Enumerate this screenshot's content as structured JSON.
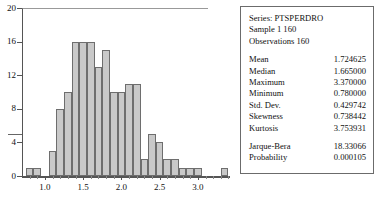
{
  "chart_data": {
    "type": "bar",
    "title": "",
    "xlabel": "",
    "ylabel": "",
    "ylim": [
      0,
      20
    ],
    "xlim": [
      0.7,
      3.42
    ],
    "grid": false,
    "legend": "none",
    "yticks": [
      0,
      4,
      8,
      12,
      16,
      20
    ],
    "xticks": [
      1.0,
      1.5,
      2.0,
      2.5,
      3.0
    ],
    "xtick_labels": [
      "1.0",
      "1.5",
      "2.0",
      "2.5",
      "3.0"
    ],
    "bin_width": 0.1,
    "bin_starts": [
      0.75,
      0.85,
      1.05,
      1.15,
      1.25,
      1.35,
      1.45,
      1.55,
      1.65,
      1.75,
      1.85,
      1.95,
      2.05,
      2.15,
      2.25,
      2.35,
      2.45,
      2.55,
      2.65,
      2.75,
      2.85,
      2.95,
      3.3
    ],
    "values": [
      1,
      1,
      3,
      8,
      10,
      16,
      16,
      16,
      13,
      15,
      10,
      10,
      11,
      11,
      2,
      5,
      4,
      2,
      2,
      1,
      1,
      1,
      1
    ],
    "bar_fill": "#c9c9c9",
    "bar_edge": "#6e6e6e",
    "axis_color": "#555555"
  },
  "stats": {
    "series_line": "Series: PTSPERDRO",
    "sample_line": "Sample 1 160",
    "observations_line": "Observations 160",
    "rows": [
      {
        "label": "Mean",
        "value": "1.724625"
      },
      {
        "label": "Median",
        "value": "1.665000"
      },
      {
        "label": "Maximum",
        "value": "3.370000"
      },
      {
        "label": "Minimum",
        "value": "0.780000"
      },
      {
        "label": "Std. Dev.",
        "value": "0.429742"
      },
      {
        "label": "Skewness",
        "value": "0.738442"
      },
      {
        "label": "Kurtosis",
        "value": "3.753931"
      }
    ],
    "test_rows": [
      {
        "label": "Jarque-Bera",
        "value": "18.33066"
      },
      {
        "label": "Probability",
        "value": "0.000105"
      }
    ]
  }
}
